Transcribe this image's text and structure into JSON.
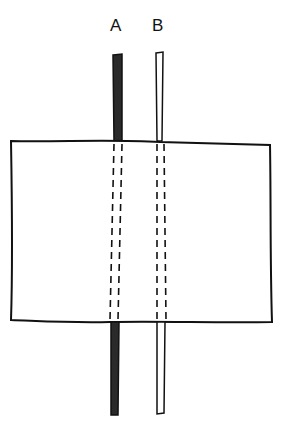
{
  "diagram": {
    "labels": [
      {
        "id": "A",
        "text": "A",
        "x": 110
      },
      {
        "id": "B",
        "text": "B",
        "x": 152
      }
    ],
    "strips": [
      {
        "id": "A",
        "fill": "#2a2a2a",
        "style": "solid-dark"
      },
      {
        "id": "B",
        "fill": "#ffffff",
        "style": "outline"
      }
    ],
    "box": {
      "fill": "#ffffff",
      "stroke": "#111111"
    }
  }
}
